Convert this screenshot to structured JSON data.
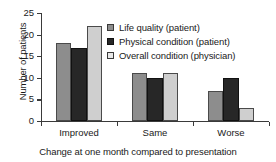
{
  "chart_data": {
    "type": "bar",
    "title": "",
    "xlabel": "Change at one month compared to presentation",
    "ylabel": "Number of patients",
    "categories": [
      "Improved",
      "Same",
      "Worse"
    ],
    "series": [
      {
        "name": "Life quality (patient)",
        "color": "#8d8d8d",
        "values": [
          18,
          11,
          7
        ]
      },
      {
        "name": "Physical condition (patient)",
        "color": "#272727",
        "values": [
          17,
          10,
          10
        ]
      },
      {
        "name": "Overall condition (physician)",
        "color": "#cfcfcf",
        "values": [
          22,
          11,
          3
        ]
      }
    ],
    "ylim": [
      0,
      25
    ],
    "yticks": [
      0,
      5,
      10,
      15,
      20,
      25
    ],
    "ytick_labels": [
      "0",
      "5",
      "10",
      "15",
      "20",
      "25"
    ],
    "grid": false,
    "legend_position": "top-right"
  }
}
